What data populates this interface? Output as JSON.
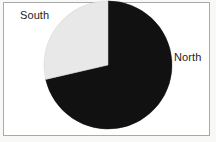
{
  "figure": {
    "background_color": "#ffffff",
    "frame_color": "#a9a9a9"
  },
  "chart_data": {
    "type": "pie",
    "title": "",
    "subtitle": "",
    "xlabel": "",
    "ylabel": "",
    "grid": false,
    "legend_position": "none",
    "labels_position": "outside",
    "start_angle_deg": 0,
    "direction": "clockwise",
    "categories": [
      "North",
      "South"
    ],
    "values": [
      71,
      29
    ],
    "slices": [
      {
        "label": "North",
        "value": 71,
        "percent": "71%",
        "color": "#111111",
        "start_angle_deg": 0,
        "end_angle_deg": 257
      },
      {
        "label": "South",
        "value": 29,
        "percent": "29%",
        "color": "#e8e8e8",
        "start_angle_deg": 257,
        "end_angle_deg": 360
      }
    ],
    "geometry": {
      "center_x": 108,
      "center_y": 65,
      "radius": 64
    }
  },
  "labels": {
    "north": "North",
    "south": "South"
  }
}
